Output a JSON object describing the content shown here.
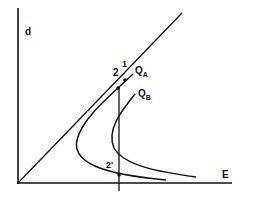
{
  "diagram": {
    "axes": {
      "y_label": "d",
      "x_label": "E"
    },
    "curves": [
      {
        "name": "Q",
        "subscript": "A"
      },
      {
        "name": "Q",
        "subscript": "B"
      }
    ],
    "points": {
      "p1": "1",
      "p2": "2",
      "p2prime": "2'"
    },
    "colors": {
      "line": "#111111",
      "background": "#ffffff"
    }
  }
}
